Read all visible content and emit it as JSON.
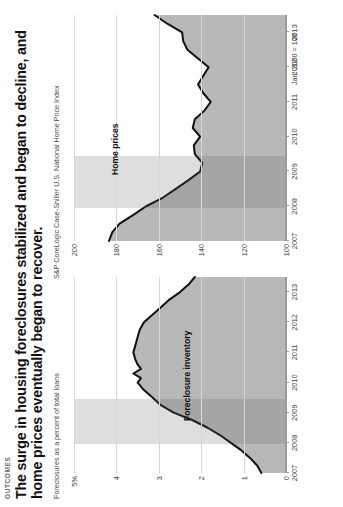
{
  "header": {
    "kicker": "OUTCOMES",
    "headline": "The surge in housing foreclosures stabilized and began to decline, and home prices eventually began to recover.",
    "subnote": "Foreclosures as a percent of total loans",
    "source": "S&P CoreLogic Case-Shiller U.S. National Home Price Index"
  },
  "chart_data": [
    {
      "type": "area",
      "title": "Foreclosure inventory",
      "series_label": "Foreclosure inventory",
      "xlabel": "",
      "ylabel": "Foreclosures as a percent of total loans",
      "ylim": [
        0,
        5
      ],
      "yticks": [
        0,
        1,
        2,
        3,
        4,
        5
      ],
      "ytick_labels": [
        "0",
        "1",
        "2",
        "3",
        "4",
        "5%"
      ],
      "xlim": [
        2007,
        2013.5
      ],
      "xticks": [
        2007,
        2008,
        2009,
        2010,
        2011,
        2012,
        2013
      ],
      "xtick_labels": [
        "2007",
        "2008",
        "2009",
        "2010",
        "2011",
        "2012",
        "2013"
      ],
      "grid": true,
      "legend": "none",
      "shaded_region": {
        "label": "recession",
        "start": 2007.95,
        "end": 2009.45
      },
      "x": [
        2007.0,
        2007.25,
        2007.5,
        2007.75,
        2008.0,
        2008.25,
        2008.5,
        2008.75,
        2009.0,
        2009.25,
        2009.5,
        2009.75,
        2010.0,
        2010.15,
        2010.3,
        2010.45,
        2010.6,
        2010.75,
        2011.0,
        2011.25,
        2011.5,
        2011.75,
        2012.0,
        2012.25,
        2012.5,
        2012.75,
        2013.0,
        2013.25,
        2013.5
      ],
      "values": [
        0.58,
        0.68,
        0.85,
        1.05,
        1.3,
        1.55,
        1.85,
        2.2,
        2.65,
        2.95,
        3.15,
        3.35,
        3.5,
        3.42,
        3.6,
        3.42,
        3.5,
        3.55,
        3.6,
        3.55,
        3.5,
        3.45,
        3.35,
        3.15,
        2.95,
        2.75,
        2.5,
        2.3,
        2.15
      ]
    },
    {
      "type": "line",
      "title": "Home prices",
      "series_label": "Home prices",
      "xlabel": "",
      "ylabel": "Jan. 2000 = 100",
      "unit_note": "Jan. 2000 = 100",
      "ylim": [
        100,
        200
      ],
      "yticks": [
        100,
        120,
        140,
        160,
        180,
        200
      ],
      "ytick_labels": [
        "100",
        "120",
        "140",
        "160",
        "180",
        "200"
      ],
      "xlim": [
        2007,
        2013.5
      ],
      "xticks": [
        2007,
        2008,
        2009,
        2010,
        2011,
        2012,
        2013
      ],
      "xtick_labels": [
        "2007",
        "2008",
        "2009",
        "2010",
        "2011",
        "2012",
        "2013"
      ],
      "grid": true,
      "legend": "none",
      "shaded_region": {
        "label": "recession",
        "start": 2007.95,
        "end": 2009.45
      },
      "x": [
        2007.0,
        2007.25,
        2007.5,
        2007.75,
        2008.0,
        2008.25,
        2008.5,
        2008.75,
        2009.0,
        2009.25,
        2009.5,
        2009.75,
        2010.0,
        2010.25,
        2010.5,
        2010.75,
        2011.0,
        2011.25,
        2011.5,
        2011.75,
        2012.0,
        2012.25,
        2012.5,
        2012.75,
        2013.0,
        2013.25,
        2013.5
      ],
      "values": [
        183.5,
        182.0,
        178.5,
        172.0,
        166.0,
        158.0,
        152.0,
        146.0,
        140.5,
        139.5,
        143.0,
        143.5,
        140.5,
        144.0,
        143.0,
        138.5,
        135.5,
        139.0,
        141.5,
        139.0,
        136.5,
        141.5,
        146.5,
        148.5,
        149.0,
        156.0,
        162.0
      ]
    }
  ]
}
